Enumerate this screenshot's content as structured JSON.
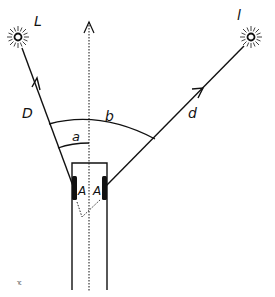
{
  "diagram": {
    "labels": {
      "light_left": "L",
      "light_right": "l",
      "ray_left": "D",
      "ray_right": "d",
      "angle_small": "a",
      "angle_large": "b",
      "eye_left": "A",
      "eye_right": "A",
      "corner_mark": "ᅚ"
    },
    "icons": {
      "light_left": "sun-icon",
      "light_right": "sun-icon"
    },
    "colors": {
      "ink": "#111111",
      "background": "#ffffff"
    }
  }
}
